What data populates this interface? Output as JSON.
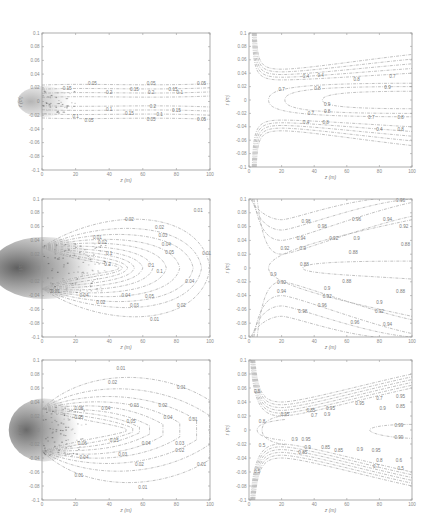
{
  "figure": {
    "layout": {
      "rows": 3,
      "cols": 2
    }
  },
  "chart_data": [
    {
      "id": "top-left",
      "type": "contour",
      "xlabel": "z (m)",
      "ylabel": "r (m)",
      "xlim": [
        0,
        100
      ],
      "ylim": [
        -0.1,
        0.1
      ],
      "xticks": [
        "0",
        "20",
        "40",
        "60",
        "80",
        "100"
      ],
      "yticks": [
        "-0.1",
        "-0.08",
        "-0.06",
        "-0.04",
        "-0.02",
        "0",
        "0.02",
        "0.04",
        "0.06",
        "0.08",
        "0.1"
      ],
      "box": [
        42,
        33,
        210,
        170
      ],
      "contour_levels": [
        "0.05",
        "0.1",
        "0.15",
        "0.2",
        "0.25",
        "0.3"
      ],
      "description": "Narrow horizontal band of contours confined to |r| < 0.025 across the full z range; dense near z=0",
      "dense_region": {
        "z": [
          0,
          15
        ],
        "r": [
          -0.015,
          0.015
        ],
        "darkness": 0.35
      }
    },
    {
      "id": "top-right",
      "type": "contour",
      "xlabel": "z (m)",
      "ylabel": "r (m)",
      "xlim": [
        0,
        100
      ],
      "ylim": [
        -0.1,
        0.1
      ],
      "xticks": [
        "0",
        "20",
        "40",
        "60",
        "80",
        "100"
      ],
      "yticks": [
        "-0.1",
        "-0.08",
        "-0.06",
        "-0.04",
        "-0.02",
        "0",
        "0.02",
        "0.04",
        "0.06",
        "0.08",
        "0.1"
      ],
      "box": [
        249,
        33,
        412,
        167
      ],
      "contour_levels": [
        "0.4",
        "0.5",
        "0.6",
        "0.7",
        "0.8",
        "0.9"
      ],
      "description": "Contours rise vertically near z=0 then turn horizontal around r=±0.035; nested U-shaped contours opening toward +z"
    },
    {
      "id": "middle-left",
      "type": "contour",
      "xlabel": "z (m)",
      "ylabel": "r (m)",
      "xlim": [
        0,
        100
      ],
      "ylim": [
        -0.1,
        0.1
      ],
      "xticks": [
        "0",
        "20",
        "40",
        "60",
        "80",
        "100"
      ],
      "yticks": [
        "-0.1",
        "-0.08",
        "-0.06",
        "-0.04",
        "-0.02",
        "0",
        "0.02",
        "0.04",
        "0.06",
        "0.08",
        "0.1"
      ],
      "box": [
        42,
        199,
        210,
        337
      ],
      "contour_levels": [
        "0.01",
        "0.02",
        "0.03",
        "0.04",
        "0.05",
        "0.1",
        "0.2"
      ],
      "description": "Expanding elliptical contours from dense source near z=0 out to z≈100, widening to r≈±0.09",
      "dense_region": {
        "z": [
          0,
          30
        ],
        "r": [
          -0.03,
          0.03
        ],
        "darkness": 0.75
      }
    },
    {
      "id": "middle-right",
      "type": "contour",
      "xlabel": "z (m)",
      "ylabel": "r (m)",
      "xlim": [
        0,
        100
      ],
      "ylim": [
        -0.1,
        0.1
      ],
      "xticks": [
        "0",
        "20",
        "40",
        "60",
        "80",
        "100"
      ],
      "yticks": [
        "-0.1",
        "-0.08",
        "-0.06",
        "-0.04",
        "-0.02",
        "0",
        "0.02",
        "0.04",
        "0.06",
        "0.08",
        "0.1"
      ],
      "box": [
        249,
        199,
        412,
        337
      ],
      "contour_levels": [
        "0.88",
        "0.9",
        "0.92",
        "0.94",
        "0.96",
        "0.98"
      ],
      "description": "Contours diverging outward from a throat near z≈15, r=0; nested V-shaped contours opening toward +z"
    },
    {
      "id": "bottom-left",
      "type": "contour",
      "xlabel": "z (m)",
      "ylabel": "r (m)",
      "xlim": [
        0,
        100
      ],
      "ylim": [
        -0.1,
        0.1
      ],
      "xticks": [
        "0",
        "20",
        "40",
        "60",
        "80",
        "100"
      ],
      "yticks": [
        "-0.1",
        "-0.08",
        "-0.06",
        "-0.04",
        "-0.02",
        "0",
        "0.02",
        "0.04",
        "0.06",
        "0.08",
        "0.1"
      ],
      "box": [
        42,
        360,
        210,
        500
      ],
      "contour_levels": [
        "0.01",
        "0.02",
        "0.03",
        "0.04",
        "0.05",
        "0.06"
      ],
      "description": "Closed lobed contours centered near z≈45; outer 0.01 contour bulges to r≈±0.09 around z≈60",
      "dense_region": {
        "z": [
          0,
          20
        ],
        "r": [
          -0.03,
          0.03
        ],
        "darkness": 0.7
      }
    },
    {
      "id": "bottom-right",
      "type": "contour",
      "xlabel": "z (m)",
      "ylabel": "r (m)",
      "xlim": [
        0,
        100
      ],
      "ylim": [
        -0.1,
        0.1
      ],
      "xticks": [
        "0",
        "20",
        "40",
        "60",
        "80",
        "100"
      ],
      "yticks": [
        "-0.1",
        "-0.08",
        "-0.06",
        "-0.04",
        "-0.02",
        "0",
        "0.02",
        "0.04",
        "0.06",
        "0.08",
        "0.1"
      ],
      "box": [
        249,
        360,
        412,
        500
      ],
      "contour_levels": [
        "0.5",
        "0.6",
        "0.7",
        "0.8",
        "0.85",
        "0.9",
        "0.95",
        "0.99"
      ],
      "description": "Widening wedge-shaped bands of contours from a throat near z≈10; a small closed 0.99 contour near z≈75-100 on axis"
    }
  ]
}
